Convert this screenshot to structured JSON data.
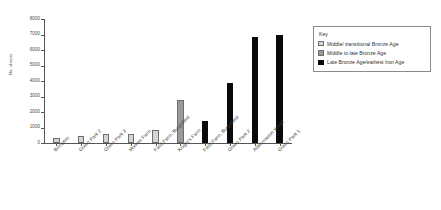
{
  "chart_data": {
    "type": "bar",
    "title": "",
    "xlabel": "",
    "ylabel": "No. sherds",
    "ylim": [
      0,
      8000
    ],
    "yticks": [
      0,
      1000,
      2000,
      3000,
      4000,
      5000,
      6000,
      7000,
      8000
    ],
    "grid": false,
    "legend_position": "right",
    "categories": [
      "Brimpton",
      "Green Park 2",
      "Green Park 3",
      "Moores Farm",
      "Field Farm, Burghfield",
      "Knight's Farm",
      "Field Farm, Burghfield",
      "Green Park 2",
      "Aldermaston Wharf",
      "Green Park 1"
    ],
    "values": [
      300,
      480,
      600,
      580,
      850,
      2800,
      1420,
      3880,
      6830,
      7000
    ],
    "point_groups": [
      "Middle/ transitional Bronze Age",
      "Middle/ transitional Bronze Age",
      "Middle/ transitional Bronze Age",
      "Middle/ transitional Bronze Age",
      "Middle/ transitional Bronze Age",
      "Middle to late Bronze Age",
      "Late Bronze Age/earliest Iron Age",
      "Late Bronze Age/earliest Iron Age",
      "Late Bronze Age/earliest Iron Age",
      "Late Bronze Age/earliest Iron Age"
    ],
    "colors": {
      "Middle/ transitional Bronze Age": "#d4d4d4",
      "Middle to late Bronze Age": "#9a9a9a",
      "Late Bronze Age/earliest Iron Age": "#0a0a0a"
    }
  },
  "legend": {
    "title": "Key",
    "items": [
      {
        "label": "Middle/ transitional Bronze Age",
        "color": "#d4d4d4"
      },
      {
        "label": "Middle to late Bronze Age",
        "color": "#9a9a9a"
      },
      {
        "label": "Late Bronze Age/earliest Iron Age",
        "color": "#0a0a0a"
      }
    ]
  }
}
